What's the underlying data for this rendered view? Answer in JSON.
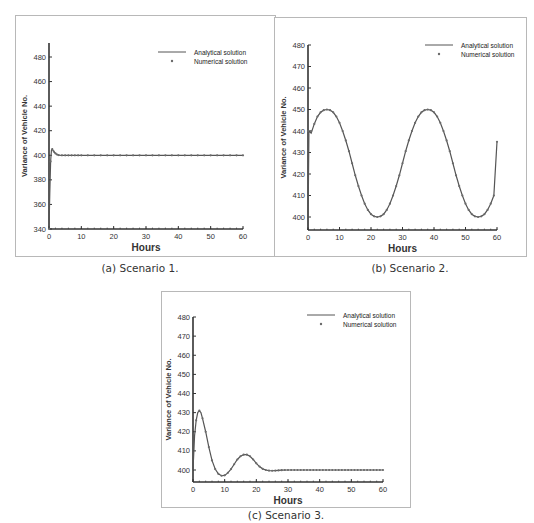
{
  "chart_data": [
    {
      "id": "a",
      "type": "line",
      "title": "",
      "caption": "(a) Scenario 1.",
      "xlabel": "Hours",
      "ylabel": "Variance of Vehicle No.",
      "xlim": [
        0,
        60
      ],
      "ylim": [
        340,
        490
      ],
      "xticks": [
        0,
        10,
        20,
        30,
        40,
        50,
        60
      ],
      "yticks": [
        340,
        360,
        380,
        400,
        420,
        440,
        460,
        480
      ],
      "grid": false,
      "legend_position": "upper right",
      "series": [
        {
          "name": "Analytical solution",
          "style": "line",
          "x": [
            0,
            0.25,
            0.5,
            0.75,
            1.0,
            1.5,
            2.0,
            2.5,
            3.0,
            4.0,
            5,
            10,
            20,
            30,
            40,
            50,
            60
          ],
          "y": [
            340,
            370,
            395,
            404,
            405,
            403,
            401.5,
            400.6,
            400.2,
            400,
            400,
            400,
            400,
            400,
            400,
            400,
            400
          ]
        },
        {
          "name": "Numerical solution",
          "style": "markers",
          "x": [
            0,
            0.5,
            1,
            1.5,
            2,
            2.5,
            3,
            4,
            5,
            6,
            7,
            8,
            9,
            10,
            12,
            14,
            16,
            18,
            20,
            22,
            24,
            26,
            28,
            30,
            32,
            34,
            36,
            38,
            40,
            42,
            44,
            46,
            48,
            50,
            52,
            54,
            56,
            58,
            60
          ],
          "y": [
            340,
            395,
            405,
            403,
            401.5,
            400.6,
            400.2,
            400,
            400,
            400,
            400,
            400,
            400,
            400,
            400,
            400,
            400,
            400,
            400,
            400,
            400,
            400,
            400,
            400,
            400,
            400,
            400,
            400,
            400,
            400,
            400,
            400,
            400,
            400,
            400,
            400,
            400,
            400,
            400
          ]
        }
      ]
    },
    {
      "id": "b",
      "type": "line",
      "title": "",
      "caption": "(b) Scenario 2.",
      "xlabel": "Hours",
      "ylabel": "Variance of Vehicle No.",
      "xlim": [
        0,
        60
      ],
      "ylim": [
        395,
        480
      ],
      "xticks": [
        0,
        10,
        20,
        30,
        40,
        50,
        60
      ],
      "yticks": [
        400,
        410,
        420,
        430,
        440,
        450,
        460,
        470,
        480
      ],
      "grid": false,
      "legend_position": "upper right",
      "series": [
        {
          "name": "Analytical solution",
          "style": "line",
          "x": [
            0,
            0.3,
            1,
            2,
            3,
            4,
            5,
            6,
            7,
            8,
            9,
            10,
            11,
            12,
            13,
            14,
            15,
            16,
            17,
            18,
            19,
            20,
            21,
            22,
            23,
            24,
            25,
            26,
            27,
            28,
            29,
            30,
            31,
            32,
            33,
            34,
            35,
            36,
            37,
            38,
            39,
            40,
            41,
            42,
            43,
            44,
            45,
            46,
            47,
            48,
            49,
            50,
            51,
            52,
            53,
            54,
            55,
            56,
            57,
            58,
            59,
            60
          ],
          "y": [
            395,
            440,
            439,
            443.3,
            446.7,
            448.7,
            449.7,
            450,
            449.7,
            448.7,
            446.7,
            443.8,
            440.0,
            435.6,
            430.6,
            425.0,
            419.4,
            414.4,
            410.0,
            406.2,
            403.3,
            401.3,
            400.3,
            400,
            400.3,
            401.3,
            403.3,
            406.2,
            410.0,
            414.4,
            419.4,
            425.0,
            430.6,
            435.6,
            440.0,
            443.8,
            446.7,
            448.7,
            449.7,
            450,
            449.7,
            448.7,
            446.7,
            443.8,
            440.0,
            435.6,
            430.6,
            425.0,
            419.4,
            414.4,
            410.0,
            406.2,
            403.3,
            401.3,
            400.3,
            400,
            400.3,
            401.3,
            403.3,
            406.2,
            410.0,
            435.0
          ]
        },
        {
          "name": "Numerical solution",
          "style": "markers",
          "x": [
            0,
            1,
            2,
            3,
            4,
            5,
            6,
            7,
            8,
            9,
            10,
            11,
            12,
            13,
            14,
            15,
            16,
            17,
            18,
            19,
            20,
            21,
            22,
            23,
            24,
            25,
            26,
            27,
            28,
            29,
            30,
            31,
            32,
            33,
            34,
            35,
            36,
            37,
            38,
            39,
            40,
            41,
            42,
            43,
            44,
            45,
            46,
            47,
            48,
            49,
            50,
            51,
            52,
            53,
            54,
            55,
            56,
            57,
            58,
            59,
            60
          ],
          "y": [
            440,
            440,
            443.3,
            446.7,
            448.7,
            449.7,
            450,
            449.7,
            448.7,
            446.7,
            443.8,
            440.0,
            435.6,
            430.6,
            425.0,
            419.4,
            414.4,
            410.0,
            406.2,
            403.3,
            401.3,
            400.3,
            400,
            400.3,
            401.3,
            403.3,
            406.2,
            410.0,
            414.4,
            419.4,
            425.0,
            430.6,
            435.6,
            440.0,
            443.8,
            446.7,
            448.7,
            449.7,
            450,
            449.7,
            448.7,
            446.7,
            443.8,
            440.0,
            435.6,
            430.6,
            425.0,
            419.4,
            414.4,
            410.0,
            406.2,
            403.3,
            401.3,
            400.3,
            400,
            400.3,
            401.3,
            403.3,
            406.2,
            410.0,
            435.0
          ]
        }
      ]
    },
    {
      "id": "c",
      "type": "line",
      "title": "",
      "caption": "(c) Scenario 3.",
      "xlabel": "Hours",
      "ylabel": "Variance of Vehicle No.",
      "xlim": [
        0,
        60
      ],
      "ylim": [
        395,
        480
      ],
      "xticks": [
        0,
        10,
        20,
        30,
        40,
        50,
        60
      ],
      "yticks": [
        400,
        410,
        420,
        430,
        440,
        450,
        460,
        470,
        480
      ],
      "grid": false,
      "legend_position": "upper right",
      "series": [
        {
          "name": "Analytical solution",
          "style": "line",
          "x": [
            0,
            0.5,
            1,
            1.5,
            2,
            2.5,
            3,
            4,
            5,
            6,
            7,
            8,
            9,
            10,
            11,
            12,
            13,
            14,
            15,
            16,
            17,
            18,
            19,
            20,
            21,
            22,
            23,
            24,
            25,
            26,
            27,
            28,
            30,
            35,
            40,
            45,
            50,
            55,
            60
          ],
          "y": [
            400,
            418,
            426,
            430,
            431,
            430,
            427,
            420,
            412,
            405,
            400.5,
            398,
            397,
            397.2,
            398.5,
            400.5,
            403,
            405.5,
            407.2,
            408,
            408,
            407.2,
            405.5,
            403.5,
            401.8,
            400.6,
            400,
            399.7,
            399.6,
            399.7,
            399.8,
            399.9,
            400,
            400,
            400,
            400,
            400,
            400,
            400
          ]
        },
        {
          "name": "Numerical solution",
          "style": "markers",
          "x": [
            1,
            2,
            3,
            4,
            5,
            6,
            7,
            8,
            9,
            10,
            11,
            12,
            13,
            14,
            15,
            16,
            17,
            18,
            19,
            20,
            21,
            22,
            23,
            24,
            25,
            26,
            27,
            28,
            29,
            30,
            31,
            32,
            33,
            34,
            35,
            36,
            37,
            38,
            39,
            40,
            41,
            42,
            43,
            44,
            45,
            46,
            47,
            48,
            49,
            50,
            51,
            52,
            53,
            54,
            55,
            56,
            57,
            58,
            59,
            60
          ],
          "y": [
            426,
            431,
            427,
            420,
            412,
            405,
            400.5,
            398,
            397,
            397.2,
            398.5,
            400.5,
            403,
            405.5,
            407.2,
            408,
            408,
            407.2,
            405.5,
            403.5,
            401.8,
            400.6,
            400,
            399.7,
            399.6,
            399.7,
            399.8,
            399.9,
            400,
            400,
            400,
            400,
            400,
            400,
            400,
            400,
            400,
            400,
            400,
            400,
            400,
            400,
            400,
            400,
            400,
            400,
            400,
            400,
            400,
            400,
            400,
            400,
            400,
            400,
            400,
            400,
            400,
            400,
            400,
            400
          ]
        }
      ]
    }
  ],
  "captions": {
    "a": "(a) Scenario 1.",
    "b": "(b) Scenario 2.",
    "c": "(c) Scenario 3."
  },
  "legend": {
    "analytical": "Analytical solution",
    "numerical": "Numerical solution"
  },
  "axis": {
    "xlabel": "Hours",
    "ylabel": "Variance of Vehicle No."
  },
  "colors": {
    "line": "#555555",
    "marker": "#6a6a6a",
    "axis": "#333333",
    "frame": "#b8b8b8"
  }
}
